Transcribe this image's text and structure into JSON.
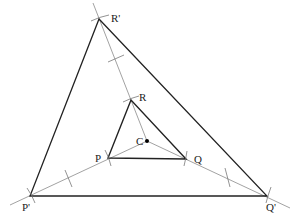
{
  "diagram": {
    "type": "enlargement-construction",
    "center": {
      "label": "C",
      "x": 147,
      "y": 141
    },
    "inner_triangle": [
      {
        "label": "P",
        "x": 108,
        "y": 158
      },
      {
        "label": "Q",
        "x": 186,
        "y": 159
      },
      {
        "label": "R",
        "x": 131,
        "y": 100
      }
    ],
    "outer_triangle": [
      {
        "label": "P'",
        "x": 30,
        "y": 196
      },
      {
        "label": "Q'",
        "x": 267,
        "y": 196
      },
      {
        "label": "R'",
        "x": 99,
        "y": 19
      }
    ],
    "labels": {
      "C": "C",
      "P": "P",
      "Q": "Q",
      "R": "R",
      "P_prime": "P'",
      "Q_prime": "Q'",
      "R_prime": "R'"
    },
    "colors": {
      "triangle_stroke": "#222222",
      "ray_stroke": "#888888"
    }
  }
}
